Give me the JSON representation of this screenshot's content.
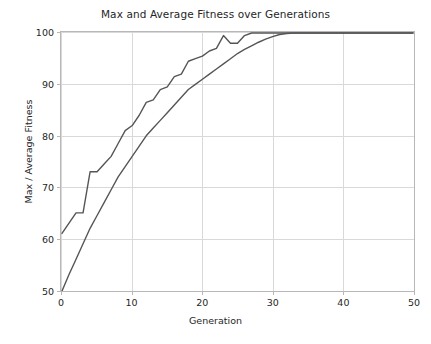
{
  "chart_data": {
    "type": "line",
    "title": "Max and Average Fitness over Generations",
    "xlabel": "Generation",
    "ylabel": "Max / Average Fitness",
    "xlim": [
      0,
      50
    ],
    "ylim": [
      50,
      100
    ],
    "xticks": [
      0,
      10,
      20,
      30,
      40,
      50
    ],
    "yticks": [
      50,
      60,
      70,
      80,
      90,
      100
    ],
    "xtick_labels": [
      "0",
      "10",
      "20",
      "30",
      "40",
      "50"
    ],
    "ytick_labels": [
      "50",
      "60",
      "70",
      "80",
      "90",
      "100"
    ],
    "grid": true,
    "legend": null,
    "line_color": "#555555",
    "grid_color": "#d9d9d9",
    "spine_color": "#b8b8b8",
    "background": "#ffffff",
    "x": [
      0,
      1,
      2,
      3,
      4,
      5,
      6,
      7,
      8,
      9,
      10,
      11,
      12,
      13,
      14,
      15,
      16,
      17,
      18,
      19,
      20,
      21,
      22,
      23,
      24,
      25,
      26,
      27,
      28,
      29,
      30,
      31,
      32,
      33,
      34,
      35,
      36,
      37,
      38,
      39,
      40,
      41,
      42,
      43,
      44,
      45,
      46,
      47,
      48,
      49,
      50
    ],
    "series": [
      {
        "name": "Max Fitness",
        "values": [
          61.0,
          63.0,
          65.0,
          65.0,
          73.0,
          73.0,
          74.5,
          76.0,
          78.5,
          81.0,
          82.0,
          84.0,
          86.5,
          87.0,
          89.0,
          89.5,
          91.5,
          92.0,
          94.5,
          95.0,
          95.5,
          96.5,
          97.0,
          99.5,
          98.0,
          98.0,
          99.5,
          100.0,
          100.0,
          100.0,
          100.0,
          100.0,
          100.0,
          100.0,
          100.0,
          100.0,
          100.0,
          100.0,
          100.0,
          100.0,
          100.0,
          100.0,
          100.0,
          100.0,
          100.0,
          100.0,
          100.0,
          100.0,
          100.0,
          100.0,
          100.0
        ]
      },
      {
        "name": "Average Fitness",
        "values": [
          49.8,
          53.0,
          56.0,
          59.0,
          62.0,
          64.5,
          67.0,
          69.5,
          72.0,
          74.0,
          76.0,
          78.0,
          80.0,
          81.5,
          83.0,
          84.5,
          86.0,
          87.5,
          89.0,
          90.0,
          91.0,
          92.0,
          93.0,
          94.0,
          95.0,
          96.0,
          96.8,
          97.5,
          98.2,
          98.8,
          99.3,
          99.7,
          99.9,
          100.0,
          100.0,
          100.0,
          100.0,
          100.0,
          100.0,
          100.0,
          100.0,
          100.0,
          100.0,
          100.0,
          100.0,
          100.0,
          100.0,
          100.0,
          100.0,
          100.0,
          100.0
        ]
      }
    ]
  }
}
